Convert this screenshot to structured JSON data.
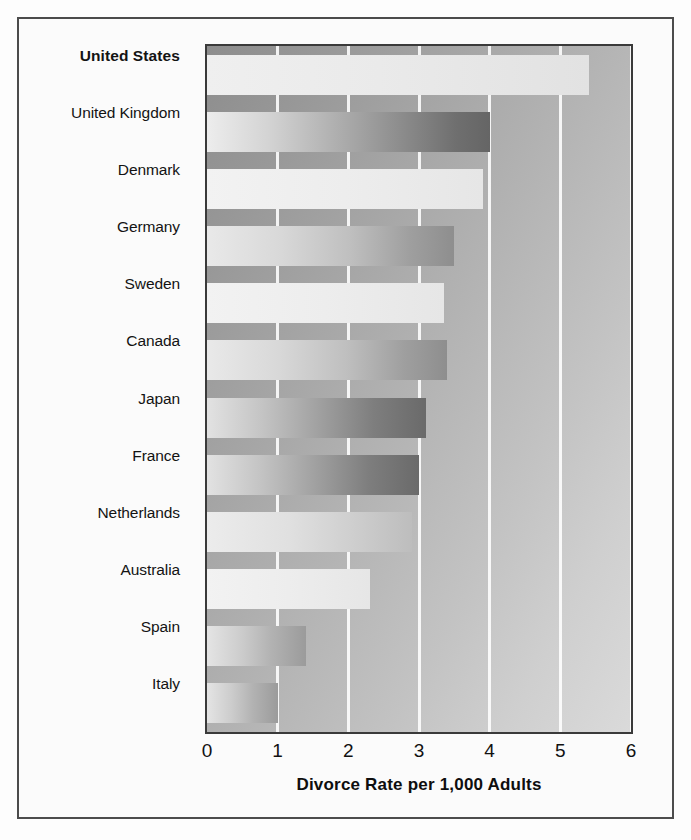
{
  "figure": {
    "background_color": "#fdfdfd",
    "frame_color": "#4c4c4c",
    "plot_background_from": "#8d8d8d",
    "plot_background_to": "#dadada",
    "gridline_color": "#ffffff"
  },
  "axis": {
    "title": "Divorce Rate per 1,000 Adults",
    "ticks": [
      "0",
      "1",
      "2",
      "3",
      "4",
      "5",
      "6"
    ]
  },
  "chart_data": {
    "type": "bar",
    "orientation": "horizontal",
    "title": "",
    "subtitle": "",
    "xlabel": "Divorce Rate per 1,000 Adults",
    "ylabel": "",
    "xlim": [
      0,
      6
    ],
    "xticks": [
      0,
      1,
      2,
      3,
      4,
      5,
      6
    ],
    "grid": true,
    "legend": false,
    "legend_position": "none",
    "categories": [
      "United States",
      "United Kingdom",
      "Denmark",
      "Germany",
      "Sweden",
      "Canada",
      "Japan",
      "France",
      "Netherlands",
      "Australia",
      "Spain",
      "Italy"
    ],
    "values": [
      5.4,
      4.0,
      3.9,
      3.5,
      3.35,
      3.4,
      3.1,
      3.0,
      2.9,
      2.3,
      1.4,
      1.0
    ],
    "highlight_category": "United States",
    "bar_styles": [
      "tone-light",
      "tone-ramp-dark",
      "tone-pale",
      "tone-ramp-mid",
      "tone-pale",
      "tone-ramp-mid",
      "tone-ramp-deep",
      "tone-ramp-deep",
      "tone-ramp-soft",
      "tone-pale",
      "tone-ramp-grey",
      "tone-ramp-grey"
    ]
  }
}
